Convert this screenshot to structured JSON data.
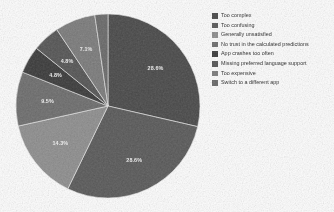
{
  "chart_data": {
    "type": "pie",
    "title": "",
    "subtitle": "",
    "xlabel": "",
    "ylabel": "",
    "legend_position": "right",
    "grid": false,
    "labels_shown_on_slices": true,
    "categories": [
      "Too complex",
      "Too confusing",
      "Generally unsatisfied",
      "No trust in the calculated predictions",
      "App crashes too often",
      "Missing preferred language support",
      "Too expensive",
      "Switch to a different app"
    ],
    "values": [
      28.6,
      28.6,
      14.3,
      9.5,
      4.8,
      4.8,
      7.1,
      2.3
    ],
    "value_labels": [
      "28.6%",
      "28.6%",
      "14.3%",
      "9.5%",
      "4.8%",
      "4.8%",
      "7.1%",
      ""
    ],
    "colors": [
      "#4a4a4a",
      "#5a5a5a",
      "#8f8f8f",
      "#6e6e6e",
      "#3b3b3b",
      "#565656",
      "#7c7c7c",
      "#6a6a6a"
    ]
  },
  "legend": {
    "items": [
      {
        "label": "Too complex",
        "color": "#4a4a4a"
      },
      {
        "label": "Too confusing",
        "color": "#5a5a5a"
      },
      {
        "label": "Generally unsatisfied",
        "color": "#8f8f8f"
      },
      {
        "label": "No trust in the calculated predictions",
        "color": "#6e6e6e"
      },
      {
        "label": "App crashes too often",
        "color": "#3b3b3b"
      },
      {
        "label": "Missing preferred language support",
        "color": "#565656"
      },
      {
        "label": "Too expensive",
        "color": "#7c7c7c"
      },
      {
        "label": "Switch to a different app",
        "color": "#6a6a6a"
      }
    ]
  },
  "slice_labels": {
    "s0": "28.6%",
    "s1": "28.6%",
    "s2": "14.3%",
    "s3": "9.5%",
    "s4": "4.8%",
    "s5": "4.8%",
    "s6": "7.1%"
  },
  "background": "#fdfdfd"
}
